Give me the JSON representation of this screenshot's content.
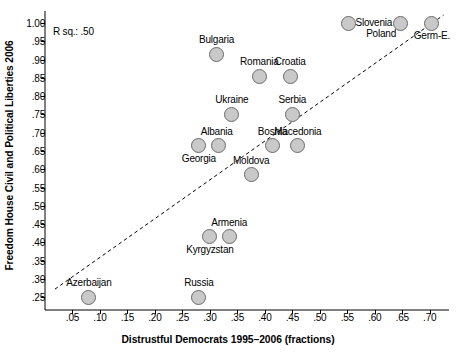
{
  "chart_data": {
    "type": "scatter",
    "title": "",
    "xlabel": "Distrustful Democrats 1995–2006 (fractions)",
    "ylabel": "Freedom House Civil and Political Liberties 2006",
    "annotation": "R sq.: .50",
    "grid": false,
    "legend": "none",
    "xlim": [
      0.0,
      0.735
    ],
    "ylim": [
      0.215,
      1.025
    ],
    "xticks": [
      ".05",
      ".10",
      ".15",
      ".20",
      ".25",
      ".30",
      ".35",
      ".40",
      ".45",
      ".50",
      ".55",
      ".60",
      ".65",
      ".70"
    ],
    "xtick_values": [
      0.05,
      0.1,
      0.15,
      0.2,
      0.25,
      0.3,
      0.35,
      0.4,
      0.45,
      0.5,
      0.55,
      0.6,
      0.65,
      0.7
    ],
    "yticks": [
      ".25",
      ".30",
      ".35",
      ".40",
      ".45",
      ".50",
      ".55",
      ".60",
      ".65",
      ".70",
      ".75",
      ".80",
      ".85",
      ".90",
      ".95",
      "1.00"
    ],
    "ytick_values": [
      0.25,
      0.3,
      0.35,
      0.4,
      0.45,
      0.5,
      0.55,
      0.6,
      0.65,
      0.7,
      0.75,
      0.8,
      0.85,
      0.9,
      0.95,
      1.0
    ],
    "marker_color": "#c9c9c9",
    "marker_edge_color": "#6b6b6b",
    "trendline": {
      "style": "dashed",
      "x0": 0.018,
      "y0": 0.272,
      "x1": 0.725,
      "y1": 1.022
    },
    "points": [
      {
        "label": "Azerbaijan",
        "x": 0.08,
        "y": 0.25,
        "label_pos": "above-center"
      },
      {
        "label": "Russia",
        "x": 0.28,
        "y": 0.25,
        "label_pos": "above-center"
      },
      {
        "label": "Kyrgyzstan",
        "x": 0.3,
        "y": 0.415,
        "label_pos": "below-center"
      },
      {
        "label": "Armenia",
        "x": 0.335,
        "y": 0.415,
        "label_pos": "above-center"
      },
      {
        "label": "Moldova",
        "x": 0.375,
        "y": 0.585,
        "label_pos": "above-center"
      },
      {
        "label": "Georgia",
        "x": 0.28,
        "y": 0.665,
        "label_pos": "below-center"
      },
      {
        "label": "Albania",
        "x": 0.316,
        "y": 0.665,
        "label_pos": "above-left"
      },
      {
        "label": "Bosnia",
        "x": 0.414,
        "y": 0.665,
        "label_pos": "above-center"
      },
      {
        "label": "Macedonia",
        "x": 0.46,
        "y": 0.665,
        "label_pos": "above-center"
      },
      {
        "label": "Ukraine",
        "x": 0.34,
        "y": 0.75,
        "label_pos": "above-center"
      },
      {
        "label": "Serbia",
        "x": 0.45,
        "y": 0.75,
        "label_pos": "above-center"
      },
      {
        "label": "Romania",
        "x": 0.39,
        "y": 0.855,
        "label_pos": "above-center"
      },
      {
        "label": "Croatia",
        "x": 0.446,
        "y": 0.855,
        "label_pos": "above-center"
      },
      {
        "label": "Bulgaria",
        "x": 0.312,
        "y": 0.915,
        "label_pos": "above-center"
      },
      {
        "label": "Slovenia",
        "x": 0.552,
        "y": 1.0,
        "label_pos": "right"
      },
      {
        "label": "Poland",
        "x": 0.646,
        "y": 1.0,
        "label_pos": "below-left"
      },
      {
        "label": "Germ-E.",
        "x": 0.704,
        "y": 1.0,
        "label_pos": "below-center"
      }
    ]
  }
}
